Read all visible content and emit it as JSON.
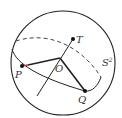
{
  "diagram": {
    "labels": {
      "P": "P",
      "O": "O",
      "T": "T",
      "Q": "Q",
      "sphere": "S",
      "sphere_exp": "2"
    },
    "colors": {
      "stroke": "#222222",
      "highlight": "#c0392b"
    }
  }
}
